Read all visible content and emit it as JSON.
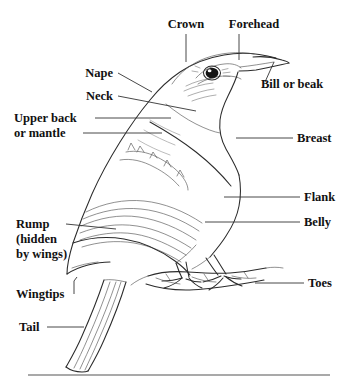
{
  "figure": {
    "style": "black-and-white pen-and-ink line drawing with leader-line labels",
    "background_color": "#ffffff",
    "ink_color": "#2b2b2b",
    "label_color": "#111111",
    "leader_color": "#333333"
  },
  "labels": [
    {
      "id": "crown",
      "text": "Crown",
      "x": 186,
      "y": 28,
      "anchor": "middle",
      "lines": [
        "Crown"
      ]
    },
    {
      "id": "forehead",
      "text": "Forehead",
      "x": 254,
      "y": 28,
      "anchor": "middle",
      "lines": [
        "Forehead"
      ]
    },
    {
      "id": "bill",
      "text": "Bill or beak",
      "x": 261,
      "y": 88,
      "anchor": "start",
      "lines": [
        "Bill or beak"
      ]
    },
    {
      "id": "nape",
      "text": "Nape",
      "x": 113,
      "y": 77,
      "anchor": "end",
      "lines": [
        "Nape"
      ]
    },
    {
      "id": "neck",
      "text": "Neck",
      "x": 113,
      "y": 100,
      "anchor": "end",
      "lines": [
        "Neck"
      ]
    },
    {
      "id": "upper-back",
      "text": "Upper back or mantle",
      "x": 14,
      "y": 122,
      "anchor": "start",
      "lines": [
        "Upper back",
        "or mantle"
      ]
    },
    {
      "id": "breast",
      "text": "Breast",
      "x": 297,
      "y": 142,
      "anchor": "start",
      "lines": [
        "Breast"
      ]
    },
    {
      "id": "flank",
      "text": "Flank",
      "x": 304,
      "y": 201,
      "anchor": "start",
      "lines": [
        "Flank"
      ]
    },
    {
      "id": "belly",
      "text": "Belly",
      "x": 304,
      "y": 226,
      "anchor": "start",
      "lines": [
        "Belly"
      ]
    },
    {
      "id": "rump",
      "text": "Rump (hidden by wings)",
      "x": 16,
      "y": 228,
      "anchor": "start",
      "lines": [
        "Rump",
        "(hidden",
        " by wings)"
      ]
    },
    {
      "id": "toes",
      "text": "Toes",
      "x": 308,
      "y": 287,
      "anchor": "start",
      "lines": [
        "Toes"
      ]
    },
    {
      "id": "wingtips",
      "text": "Wingtips",
      "x": 16,
      "y": 298,
      "anchor": "start",
      "lines": [
        "Wingtips"
      ]
    },
    {
      "id": "tail",
      "text": "Tail",
      "x": 19,
      "y": 331,
      "anchor": "start",
      "lines": [
        "Tail"
      ]
    }
  ],
  "label_text": {
    "crown": "Crown",
    "forehead": "Forehead",
    "bill": "Bill or beak",
    "nape": "Nape",
    "neck": "Neck",
    "upper_back_1": "Upper back",
    "upper_back_2": "or mantle",
    "breast": "Breast",
    "flank": "Flank",
    "belly": "Belly",
    "rump_1": "Rump",
    "rump_2": "(hidden",
    "rump_3": " by wings)",
    "toes": "Toes",
    "wingtips": "Wingtips",
    "tail": "Tail"
  },
  "leaders": [
    {
      "id": "crown-leader",
      "kind": "vertical",
      "points": "186,34 186,62"
    },
    {
      "id": "forehead-leader",
      "kind": "vertical",
      "points": "239,34 239,60"
    },
    {
      "id": "bill-leader",
      "kind": "diagonal",
      "points": "265,82 274,62"
    },
    {
      "id": "nape-leader",
      "kind": "diagonal",
      "points": "118,73 152,92"
    },
    {
      "id": "neck-leader",
      "kind": "diagonal",
      "points": "118,96 196,111"
    },
    {
      "id": "upper-back-leader-1",
      "kind": "horizontal",
      "points": "95,118 171,118"
    },
    {
      "id": "upper-back-leader-2",
      "kind": "horizontal",
      "points": "83,133 162,133"
    },
    {
      "id": "breast-leader",
      "kind": "horizontal",
      "points": "236,138 293,138"
    },
    {
      "id": "flank-leader",
      "kind": "horizontal",
      "points": "224,197 300,197"
    },
    {
      "id": "belly-leader",
      "kind": "horizontal",
      "points": "205,222 300,222"
    },
    {
      "id": "rump-leader",
      "kind": "horizontal",
      "points": "66,224 116,229"
    },
    {
      "id": "toes-leader",
      "kind": "horizontal",
      "points": "255,283 304,283"
    },
    {
      "id": "wingtips-leader",
      "kind": "elbow",
      "points": "74,294 74,283 76,278"
    },
    {
      "id": "tail-leader",
      "kind": "horizontal",
      "points": "47,327 84,327"
    }
  ],
  "bottom_rule": {
    "id": "bottom-rule",
    "x1": 28,
    "x2": 330,
    "y": 375
  },
  "anatomy_parts": [
    "Crown",
    "Forehead",
    "Bill or beak",
    "Nape",
    "Neck",
    "Upper back or mantle",
    "Breast",
    "Flank",
    "Belly",
    "Rump (hidden by wings)",
    "Toes",
    "Wingtips",
    "Tail"
  ]
}
